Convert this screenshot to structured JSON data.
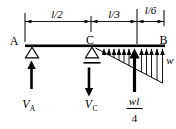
{
  "figure": {
    "kind": "beam-load-diagram",
    "ink_color": "#000000",
    "background_color": "#ffffff"
  },
  "dimension_labels": {
    "ac": "l/2",
    "cd": "l/3",
    "db": "l/6"
  },
  "node_labels": {
    "a": "A",
    "c": "C",
    "b": "B"
  },
  "reaction_labels": {
    "va": {
      "symbol": "V",
      "subscript": "A",
      "direction": "up"
    },
    "vc": {
      "symbol": "V",
      "subscript": "C",
      "direction": "down"
    }
  },
  "load_labels": {
    "intensity": "w",
    "resultant_numerator": "wl",
    "resultant_denominator": "4",
    "resultant_direction": "up"
  }
}
